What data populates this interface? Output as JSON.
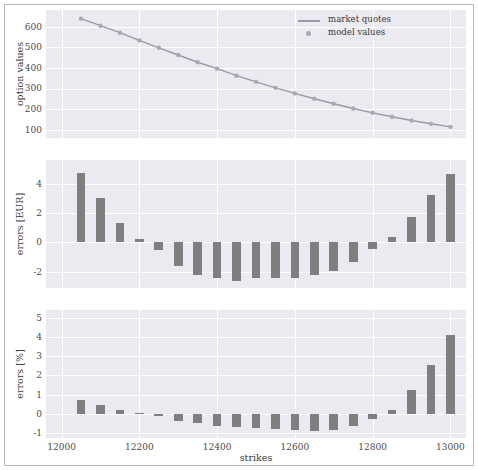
{
  "figure": {
    "xlabel": "strikes",
    "legend": [
      {
        "label": "market quotes",
        "marker": "line"
      },
      {
        "label": "model values",
        "marker": "dot"
      }
    ]
  },
  "colors": {
    "plot_background": "#eaeaf0",
    "grid": "#ffffff",
    "bar": "#7f7f7f",
    "line": "#9a9aa5",
    "marker": "#a9a9b4",
    "text": "#4a4a4a",
    "figure_border": "#b9b9b9"
  },
  "chart_data": [
    {
      "type": "line",
      "panel": "top",
      "title": "",
      "xlabel": "",
      "ylabel": "option values",
      "xlim": [
        11960,
        13040
      ],
      "ylim": [
        60,
        680
      ],
      "yticks": [
        100,
        200,
        300,
        400,
        500,
        600
      ],
      "xticks": [
        12000,
        12200,
        12400,
        12600,
        12800,
        13000
      ],
      "grid": true,
      "legend_position": "upper right",
      "x": [
        12050,
        12100,
        12150,
        12200,
        12250,
        12300,
        12350,
        12400,
        12450,
        12500,
        12550,
        12600,
        12650,
        12700,
        12750,
        12800,
        12850,
        12900,
        12950,
        13000
      ],
      "series": [
        {
          "name": "market quotes",
          "values": [
            638,
            604,
            570,
            533,
            497,
            462,
            427,
            396,
            362,
            332,
            303,
            276,
            250,
            226,
            203,
            182,
            163,
            145,
            129,
            114
          ]
        },
        {
          "name": "model values",
          "values": [
            638,
            604,
            570,
            533,
            497,
            462,
            427,
            396,
            362,
            332,
            303,
            276,
            250,
            226,
            203,
            182,
            163,
            145,
            129,
            114
          ]
        }
      ]
    },
    {
      "type": "bar",
      "panel": "middle",
      "title": "",
      "xlabel": "",
      "ylabel": "errors [EUR]",
      "xlim": [
        11960,
        13040
      ],
      "ylim": [
        -3.1,
        5.6
      ],
      "yticks": [
        -2,
        0,
        2,
        4
      ],
      "xticks": [
        12000,
        12200,
        12400,
        12600,
        12800,
        13000
      ],
      "grid": true,
      "categories": [
        12050,
        12100,
        12150,
        12200,
        12250,
        12300,
        12350,
        12400,
        12450,
        12500,
        12550,
        12600,
        12650,
        12700,
        12750,
        12800,
        12850,
        12900,
        12950,
        13000
      ],
      "values": [
        4.75,
        3.0,
        1.35,
        0.25,
        -0.55,
        -1.6,
        -2.2,
        -2.45,
        -2.6,
        -2.45,
        -2.45,
        -2.4,
        -2.25,
        -1.95,
        -1.35,
        -0.45,
        0.35,
        1.75,
        3.2,
        4.65
      ]
    },
    {
      "type": "bar",
      "panel": "bottom",
      "title": "",
      "xlabel": "strikes",
      "ylabel": "errors [%]",
      "xlim": [
        11960,
        13040
      ],
      "ylim": [
        -1.25,
        5.4
      ],
      "yticks": [
        -1,
        0,
        1,
        2,
        3,
        4,
        5
      ],
      "xticks": [
        12000,
        12200,
        12400,
        12600,
        12800,
        13000
      ],
      "grid": true,
      "categories": [
        12050,
        12100,
        12150,
        12200,
        12250,
        12300,
        12350,
        12400,
        12450,
        12500,
        12550,
        12600,
        12650,
        12700,
        12750,
        12800,
        12850,
        12900,
        12950,
        13000
      ],
      "values": [
        0.72,
        0.48,
        0.22,
        0.05,
        -0.12,
        -0.35,
        -0.5,
        -0.62,
        -0.7,
        -0.72,
        -0.78,
        -0.85,
        -0.88,
        -0.85,
        -0.65,
        -0.25,
        0.22,
        1.25,
        2.55,
        4.1
      ]
    }
  ]
}
